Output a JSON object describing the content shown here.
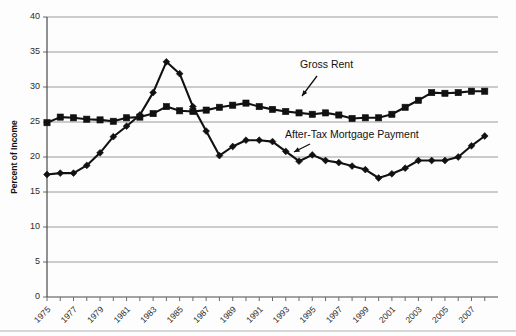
{
  "chart_data": {
    "type": "line",
    "title": "",
    "xlabel": "",
    "ylabel": "Percent of Income",
    "ylim": [
      0,
      40
    ],
    "ytick_step": 5,
    "yticks": [
      "0",
      "5",
      "10",
      "15",
      "20",
      "25",
      "30",
      "35",
      "40"
    ],
    "xlim": [
      1975,
      2008
    ],
    "grid": "horizontal",
    "legend": "annotations-inline",
    "x": [
      1975,
      1976,
      1977,
      1978,
      1979,
      1980,
      1981,
      1982,
      1983,
      1984,
      1985,
      1986,
      1987,
      1988,
      1989,
      1990,
      1991,
      1992,
      1993,
      1994,
      1995,
      1996,
      1997,
      1998,
      1999,
      2000,
      2001,
      2002,
      2003,
      2004,
      2005,
      2006,
      2007,
      2008
    ],
    "xtick_labels": [
      "1975",
      "1977",
      "1979",
      "1981",
      "1983",
      "1985",
      "1987",
      "1989",
      "1991",
      "1993",
      "1995",
      "1997",
      "1999",
      "2001",
      "2003",
      "2005",
      "2007"
    ],
    "series": [
      {
        "name": "Gross Rent",
        "marker": "square",
        "values": [
          24.9,
          25.7,
          25.6,
          25.4,
          25.3,
          25.1,
          25.6,
          25.7,
          26.2,
          27.2,
          26.6,
          26.5,
          26.7,
          27.1,
          27.4,
          27.7,
          27.2,
          26.8,
          26.5,
          26.3,
          26.1,
          26.3,
          26.0,
          25.5,
          25.6,
          25.6,
          26.1,
          27.1,
          28.1,
          29.2,
          29.1,
          29.2,
          29.4,
          29.4
        ]
      },
      {
        "name": "After-Tax Mortgage Payment",
        "marker": "diamond",
        "values": [
          17.5,
          17.7,
          17.7,
          18.8,
          20.6,
          22.9,
          24.4,
          26.0,
          29.2,
          33.6,
          31.9,
          27.2,
          23.7,
          20.2,
          21.5,
          22.4,
          22.4,
          22.2,
          20.8,
          19.4,
          20.3,
          19.5,
          19.2,
          18.7,
          18.2,
          17.0,
          17.6,
          18.4,
          19.5,
          19.5,
          19.5,
          20.0,
          21.6,
          23.0
        ]
      }
    ],
    "annotations": [
      {
        "text": "Gross Rent",
        "x": 300,
        "y": 68
      },
      {
        "text": "After-Tax Mortgage Payment",
        "x": 285,
        "y": 138
      }
    ]
  }
}
